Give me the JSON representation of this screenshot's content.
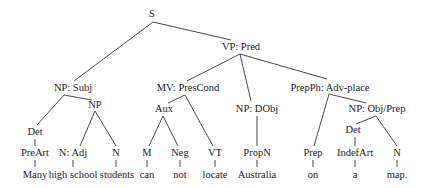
{
  "diagram": {
    "type": "syntax-tree",
    "sentence": "Many high school students can not locate Australia on a map.",
    "nodes": [
      {
        "id": "S",
        "label": "S",
        "x": 152,
        "y": 14
      },
      {
        "id": "VP",
        "label": "VP: Pred",
        "x": 241,
        "y": 47
      },
      {
        "id": "NPSubj",
        "label": "NP: Subj",
        "x": 73,
        "y": 88
      },
      {
        "id": "MV",
        "label": "MV: PresCond",
        "x": 188,
        "y": 88
      },
      {
        "id": "PrepPh",
        "label": "PrepPh: Adv-place",
        "x": 330,
        "y": 88
      },
      {
        "id": "NP1",
        "label": "NP",
        "x": 95,
        "y": 105
      },
      {
        "id": "Aux",
        "label": "Aux",
        "x": 164,
        "y": 109
      },
      {
        "id": "NPDObj",
        "label": "NP: DObj",
        "x": 257,
        "y": 109
      },
      {
        "id": "NPObjPrep",
        "label": "NP: Obj/Prep",
        "x": 377,
        "y": 109
      },
      {
        "id": "Det1",
        "label": "Det",
        "x": 35,
        "y": 132
      },
      {
        "id": "Det2",
        "label": "Det",
        "x": 353,
        "y": 130
      },
      {
        "id": "PreArt",
        "label": "PreArt",
        "x": 35,
        "y": 153
      },
      {
        "id": "NAdj",
        "label": "N: Adj",
        "x": 73,
        "y": 153
      },
      {
        "id": "N1",
        "label": "N",
        "x": 116,
        "y": 153
      },
      {
        "id": "M",
        "label": "M",
        "x": 147,
        "y": 153
      },
      {
        "id": "Neg",
        "label": "Neg",
        "x": 180,
        "y": 153
      },
      {
        "id": "VT",
        "label": "VT",
        "x": 215,
        "y": 153
      },
      {
        "id": "PropN",
        "label": "PropN",
        "x": 257,
        "y": 153
      },
      {
        "id": "Prep",
        "label": "Prep",
        "x": 313,
        "y": 153
      },
      {
        "id": "IndefArt",
        "label": "IndefArt",
        "x": 355,
        "y": 153
      },
      {
        "id": "N2",
        "label": "N",
        "x": 397,
        "y": 153
      },
      {
        "id": "w_many",
        "label": "Many",
        "x": 35,
        "y": 175
      },
      {
        "id": "w_highschool",
        "label": "high school",
        "x": 73,
        "y": 175
      },
      {
        "id": "w_students",
        "label": "students",
        "x": 117,
        "y": 175
      },
      {
        "id": "w_can",
        "label": "can",
        "x": 147,
        "y": 175
      },
      {
        "id": "w_not",
        "label": "not",
        "x": 180,
        "y": 175
      },
      {
        "id": "w_locate",
        "label": "locate",
        "x": 215,
        "y": 175
      },
      {
        "id": "w_australia",
        "label": "Australia",
        "x": 257,
        "y": 175
      },
      {
        "id": "w_on",
        "label": "on",
        "x": 313,
        "y": 175
      },
      {
        "id": "w_a",
        "label": "a",
        "x": 355,
        "y": 175
      },
      {
        "id": "w_map",
        "label": "map.",
        "x": 397,
        "y": 175
      }
    ],
    "edges": [
      {
        "from": "S",
        "to": "NPSubj",
        "x1": 153,
        "y1": 22,
        "x2": 74,
        "y2": 81
      },
      {
        "from": "S",
        "to": "VP",
        "x1": 153,
        "y1": 22,
        "x2": 231,
        "y2": 40
      },
      {
        "from": "VP",
        "to": "MV",
        "x1": 240,
        "y1": 54,
        "x2": 187,
        "y2": 81
      },
      {
        "from": "VP",
        "to": "NPDObj",
        "x1": 240,
        "y1": 54,
        "x2": 251,
        "y2": 101
      },
      {
        "from": "VP",
        "to": "PrepPh",
        "x1": 240,
        "y1": 54,
        "x2": 327,
        "y2": 79
      },
      {
        "from": "NPSubj",
        "to": "Det1",
        "x1": 64,
        "y1": 95,
        "x2": 37,
        "y2": 125
      },
      {
        "from": "NPSubj",
        "to": "NP1",
        "x1": 64,
        "y1": 95,
        "x2": 92,
        "y2": 100
      },
      {
        "from": "NP1",
        "to": "NAdj",
        "x1": 95,
        "y1": 111,
        "x2": 80,
        "y2": 146
      },
      {
        "from": "NP1",
        "to": "N1",
        "x1": 95,
        "y1": 111,
        "x2": 116,
        "y2": 146
      },
      {
        "from": "Det1",
        "to": "PreArt",
        "x1": 35,
        "y1": 139,
        "x2": 35,
        "y2": 146
      },
      {
        "from": "PreArt",
        "to": "w_many",
        "x1": 35,
        "y1": 160,
        "x2": 35,
        "y2": 167
      },
      {
        "from": "NAdj",
        "to": "w_highschool",
        "x1": 73,
        "y1": 160,
        "x2": 73,
        "y2": 167
      },
      {
        "from": "N1",
        "to": "w_students",
        "x1": 116,
        "y1": 160,
        "x2": 116,
        "y2": 167
      },
      {
        "from": "MV",
        "to": "Aux",
        "x1": 185,
        "y1": 95,
        "x2": 168,
        "y2": 103
      },
      {
        "from": "MV",
        "to": "VT",
        "x1": 185,
        "y1": 95,
        "x2": 213,
        "y2": 146
      },
      {
        "from": "Aux",
        "to": "M",
        "x1": 163,
        "y1": 116,
        "x2": 149,
        "y2": 146
      },
      {
        "from": "Aux",
        "to": "Neg",
        "x1": 163,
        "y1": 116,
        "x2": 178,
        "y2": 146
      },
      {
        "from": "M",
        "to": "w_can",
        "x1": 147,
        "y1": 160,
        "x2": 147,
        "y2": 167
      },
      {
        "from": "Neg",
        "to": "w_not",
        "x1": 180,
        "y1": 160,
        "x2": 180,
        "y2": 167
      },
      {
        "from": "VT",
        "to": "w_locate",
        "x1": 215,
        "y1": 160,
        "x2": 215,
        "y2": 167
      },
      {
        "from": "NPDObj",
        "to": "PropN",
        "x1": 257,
        "y1": 116,
        "x2": 257,
        "y2": 146
      },
      {
        "from": "PropN",
        "to": "w_australia",
        "x1": 257,
        "y1": 160,
        "x2": 257,
        "y2": 167
      },
      {
        "from": "PrepPh",
        "to": "Prep",
        "x1": 329,
        "y1": 94,
        "x2": 314,
        "y2": 146
      },
      {
        "from": "PrepPh",
        "to": "NPObjPrep",
        "x1": 329,
        "y1": 94,
        "x2": 366,
        "y2": 103
      },
      {
        "from": "NPObjPrep",
        "to": "Det2",
        "x1": 376,
        "y1": 116,
        "x2": 356,
        "y2": 124
      },
      {
        "from": "NPObjPrep",
        "to": "N2",
        "x1": 376,
        "y1": 116,
        "x2": 397,
        "y2": 146
      },
      {
        "from": "Det2",
        "to": "IndefArt",
        "x1": 355,
        "y1": 137,
        "x2": 355,
        "y2": 146
      },
      {
        "from": "Prep",
        "to": "w_on",
        "x1": 313,
        "y1": 160,
        "x2": 313,
        "y2": 167
      },
      {
        "from": "IndefArt",
        "to": "w_a",
        "x1": 355,
        "y1": 160,
        "x2": 355,
        "y2": 167
      },
      {
        "from": "N2",
        "to": "w_map",
        "x1": 397,
        "y1": 160,
        "x2": 397,
        "y2": 167
      }
    ]
  }
}
